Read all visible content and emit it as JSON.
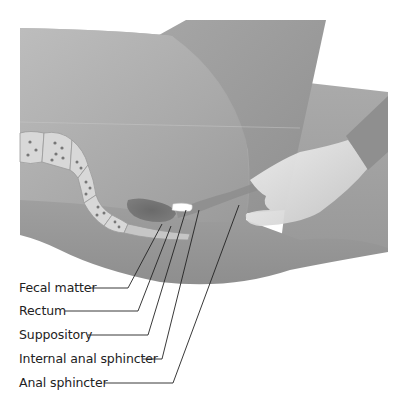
{
  "figure": {
    "type": "anatomical-illustration",
    "colors": {
      "background": "#ffffff",
      "body_light": "#b3b3b3",
      "body_dark": "#8a8a8a",
      "colon": "#d6d6d6",
      "fecal_matter": "#666666",
      "suppository": "#ffffff",
      "glove": "#e6e6e6",
      "leader_line": "#222222"
    }
  },
  "labels": [
    {
      "text": "Fecal matter",
      "y": 288,
      "line_end_x": 128,
      "target": [
        162,
        224
      ]
    },
    {
      "text": "Rectum",
      "y": 311,
      "line_end_x": 138,
      "target": [
        171,
        226
      ]
    },
    {
      "text": "Suppository",
      "y": 335,
      "line_end_x": 148,
      "target": [
        186,
        210
      ]
    },
    {
      "text": "Internal anal sphincter",
      "y": 359,
      "line_end_x": 162,
      "target": [
        199,
        210
      ]
    },
    {
      "text": "Anal sphincter",
      "y": 383,
      "line_end_x": 173,
      "target": [
        239,
        205
      ]
    }
  ]
}
